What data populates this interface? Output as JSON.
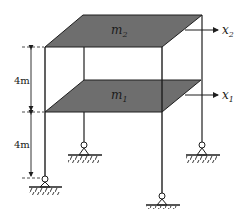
{
  "diagram": {
    "type": "two-story shear frame",
    "colors": {
      "slab_fill": "#6e6e6e",
      "line": "#1e1e1e",
      "background": "#ffffff"
    },
    "masses": [
      {
        "id": "m2",
        "symbol": "m",
        "subscript": "2",
        "level": "upper floor"
      },
      {
        "id": "m1",
        "symbol": "m",
        "subscript": "1",
        "level": "lower floor"
      }
    ],
    "displacements": [
      {
        "id": "x2",
        "symbol": "x",
        "subscript": "2"
      },
      {
        "id": "x1",
        "symbol": "x",
        "subscript": "1"
      }
    ],
    "dimensions": [
      {
        "id": "upper-story-height",
        "label": "4m"
      },
      {
        "id": "lower-story-height",
        "label": "4m"
      }
    ],
    "supports": [
      {
        "id": "front-left",
        "type": "pin"
      },
      {
        "id": "back-left",
        "type": "pin"
      },
      {
        "id": "front-right",
        "type": "pin"
      },
      {
        "id": "back-right",
        "type": "pin"
      }
    ]
  }
}
